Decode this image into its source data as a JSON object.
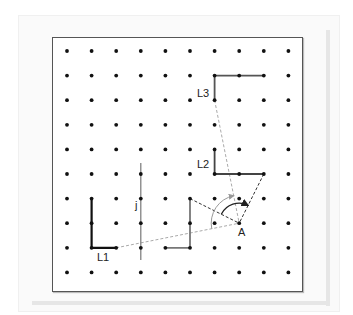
{
  "diagram": {
    "grid": {
      "columns": 10,
      "rows": 10
    },
    "labels": {
      "L1": "L1",
      "L2": "L2",
      "L3": "L3",
      "line": "j",
      "point": "A"
    },
    "shapes": {
      "L1": [
        [
          1,
          6
        ],
        [
          1,
          8
        ],
        [
          2,
          8
        ]
      ],
      "L_mid": [
        [
          4,
          8
        ],
        [
          5,
          8
        ],
        [
          5,
          6
        ]
      ],
      "L2": [
        [
          6,
          4
        ],
        [
          6,
          5
        ],
        [
          8,
          5
        ]
      ],
      "L3": [
        [
          6,
          2
        ],
        [
          6,
          1
        ],
        [
          8,
          1
        ]
      ]
    },
    "line_j": {
      "col": 3,
      "from_row": 4.55,
      "to_row": 8.5
    },
    "point_A": [
      7,
      7
    ],
    "dashed_rays": {
      "grey": [
        [
          2,
          8
        ],
        [
          6,
          2
        ]
      ],
      "dark": [
        [
          5,
          6
        ],
        [
          8,
          5
        ]
      ]
    },
    "colors": {
      "dot": "#111111",
      "L1": "#111111",
      "L_mid": "#777777",
      "L2": "#444444",
      "L3": "#555555",
      "dashed_grey": "#aaaaaa",
      "dashed_dark": "#333333",
      "line_j": "#777777"
    }
  }
}
